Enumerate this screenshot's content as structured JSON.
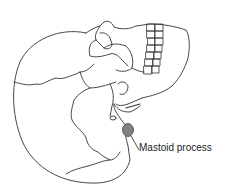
{
  "diagram": {
    "labels": [
      {
        "text": "Mastoid process",
        "target": "mastoid-process"
      }
    ],
    "highlight_color": "#808080",
    "line_color": "#333333"
  }
}
